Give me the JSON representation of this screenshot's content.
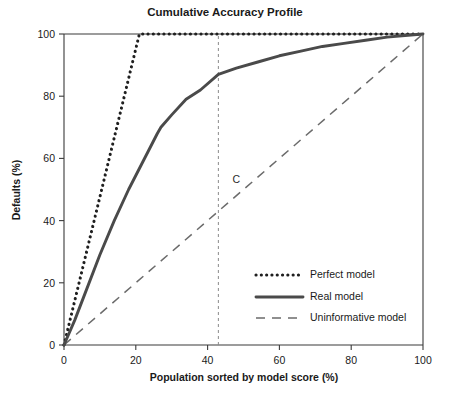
{
  "chart_data": {
    "type": "line",
    "title": "Cumulative Accuracy Profile",
    "xlabel": "Population sorted by model score (%)",
    "ylabel": "Defaults (%)",
    "xlim": [
      0,
      100
    ],
    "ylim": [
      0,
      100
    ],
    "xticks": [
      0,
      20,
      40,
      60,
      80,
      100
    ],
    "yticks": [
      0,
      20,
      40,
      60,
      80,
      100
    ],
    "xtick_labels": [
      "0",
      "20",
      "40",
      "60",
      "80",
      "100"
    ],
    "ytick_labels": [
      "0",
      "20",
      "40",
      "60",
      "80",
      "100"
    ],
    "grid": false,
    "legend_position": "lower right",
    "series": [
      {
        "name": "Perfect model",
        "style": "dotted",
        "color": "#1f1f1f",
        "x": [
          0,
          21,
          100
        ],
        "y": [
          0,
          100,
          100
        ]
      },
      {
        "name": "Real model",
        "style": "solid",
        "color": "#4a4a4a",
        "x": [
          0,
          3,
          6,
          10,
          14,
          18,
          22,
          26,
          27,
          30,
          34,
          38,
          43,
          48,
          54,
          60,
          66,
          72,
          78,
          84,
          90,
          95,
          100
        ],
        "y": [
          0,
          8,
          17,
          29,
          40,
          50,
          59,
          68,
          70,
          74,
          79,
          82,
          87,
          89,
          91,
          93,
          94.5,
          96,
          97,
          98,
          99,
          99.5,
          100
        ]
      },
      {
        "name": "Uninformative model",
        "style": "dashed",
        "color": "#6b6b6b",
        "x": [
          0,
          100
        ],
        "y": [
          0,
          100
        ]
      }
    ],
    "annotations": [
      {
        "name": "C",
        "label": "C",
        "x": 48,
        "y": 52,
        "guide": {
          "type": "vline",
          "x": 43,
          "y_from": 0,
          "y_to": 100
        }
      }
    ]
  }
}
